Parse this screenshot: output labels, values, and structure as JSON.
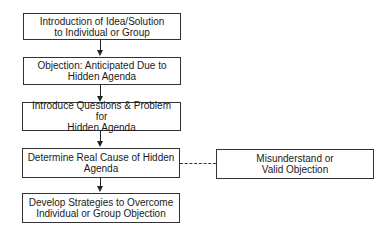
{
  "diagram": {
    "type": "flowchart",
    "main_steps": [
      {
        "id": "step1",
        "label": "Introduction of Idea/Solution\nto Individual or Group"
      },
      {
        "id": "step2",
        "label": "Objection: Anticipated Due to\nHidden Agenda"
      },
      {
        "id": "step3",
        "label": "Introduce Questions & Problem for\nHidden Agenda"
      },
      {
        "id": "step4",
        "label": "Determine Real Cause of Hidden\nAgenda"
      },
      {
        "id": "step5",
        "label": "Develop Strategies to Overcome\nIndividual or Group Objection"
      }
    ],
    "side_node": {
      "id": "side1",
      "label": "Misunderstand or\nValid Objection"
    },
    "edges": [
      {
        "from": "step1",
        "to": "step2",
        "style": "solid-arrow"
      },
      {
        "from": "step2",
        "to": "step3",
        "style": "solid-arrow"
      },
      {
        "from": "step3",
        "to": "step4",
        "style": "solid-arrow"
      },
      {
        "from": "step4",
        "to": "step5",
        "style": "solid-arrow"
      },
      {
        "from": "step4",
        "to": "side1",
        "style": "dashed-line"
      }
    ],
    "colors": {
      "line": "#222222",
      "box_border": "#333333",
      "background": "#ffffff"
    }
  }
}
